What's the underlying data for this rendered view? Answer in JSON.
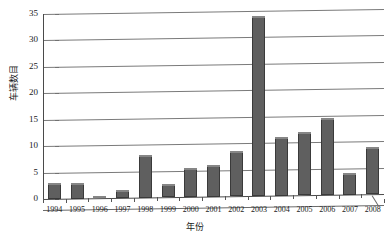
{
  "chart_data": {
    "type": "bar",
    "title": "",
    "xlabel": "年份",
    "ylabel": "车辆数目",
    "categories": [
      "1994",
      "1995",
      "1996",
      "1997",
      "1998",
      "1999",
      "2000",
      "2001",
      "2002",
      "2003",
      "2004",
      "2005",
      "2006",
      "2007",
      "2008"
    ],
    "values": [
      3,
      3,
      0.5,
      1.5,
      8,
      2.5,
      5.5,
      6,
      8.5,
      34,
      11,
      12,
      14.5,
      4,
      9
    ],
    "ylim": [
      0,
      35
    ],
    "yticks": [
      0,
      5,
      10,
      15,
      20,
      25,
      30,
      35
    ],
    "ytick_labels": [
      "0",
      "5",
      "10",
      "15",
      "20",
      "25",
      "30",
      "35"
    ],
    "grid": true,
    "legend": false,
    "bar_color": "#5f5f5f",
    "bar_edge_color": "#3a3a3a",
    "gridline_color": "#7a7a7a",
    "axis_color": "#4a4a4a",
    "background_color": "#ffffff"
  }
}
